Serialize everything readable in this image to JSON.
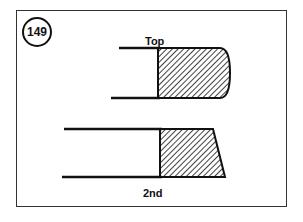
{
  "figure": {
    "number": "149",
    "rings": [
      {
        "label": "Top",
        "profile": "barrel-faced"
      },
      {
        "label": "2nd",
        "profile": "taper-faced"
      }
    ]
  },
  "colors": {
    "line": "#111111",
    "background": "#ffffff"
  }
}
